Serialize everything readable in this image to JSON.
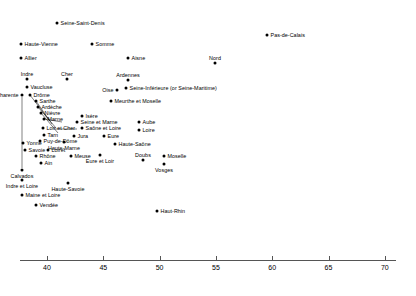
{
  "chart_data": {
    "type": "scatter",
    "title": "",
    "subtitle": "",
    "xlabel": "",
    "ylabel": "",
    "xlim": [
      37.0,
      70.0
    ],
    "ylim": [
      0,
      1
    ],
    "grid": false,
    "legend": "none",
    "axis": {
      "ticks": [
        40,
        45,
        50,
        55,
        60,
        65,
        70
      ],
      "tick_labels": [
        "40",
        "45",
        "50",
        "55",
        "60",
        "65",
        "70"
      ],
      "orientation": "horizontal",
      "position": "bottom"
    },
    "note": "Single-axis dot plot: each French department plotted by its x value; vertical offsets are for label separation only.",
    "points": [
      {
        "label": "Seine-Saint-Denis",
        "x": 44.4,
        "px": 57,
        "py": 23,
        "side": "r"
      },
      {
        "label": "Haute-Vienne",
        "x": 38.7,
        "px": 21,
        "py": 44,
        "side": "r"
      },
      {
        "label": "Somme",
        "x": 44.2,
        "px": 92,
        "py": 44,
        "side": "r"
      },
      {
        "label": "Pas-de-Calais",
        "x": 60.9,
        "px": 267,
        "py": 35,
        "side": "r"
      },
      {
        "label": "Allier",
        "x": 38.6,
        "px": 21,
        "py": 58,
        "side": "r"
      },
      {
        "label": "Aisne",
        "x": 46.4,
        "px": 128,
        "py": 58,
        "side": "r"
      },
      {
        "label": "Nord",
        "x": 52.5,
        "px": 215,
        "py": 63,
        "side": "cb"
      },
      {
        "label": "Indre",
        "x": 38.4,
        "px": 27,
        "py": 79,
        "side": "cb"
      },
      {
        "label": "Cher",
        "x": 41.2,
        "px": 67,
        "py": 79,
        "side": "cb"
      },
      {
        "label": "Ardennes",
        "x": 47.7,
        "px": 128,
        "py": 80,
        "side": "cb"
      },
      {
        "label": "Vaucluse",
        "x": 38.4,
        "px": 27,
        "py": 87,
        "side": "r"
      },
      {
        "label": "Oise",
        "x": 46.0,
        "px": 117,
        "py": 90,
        "side": "l"
      },
      {
        "label": "Seine-Inférieure (or Seine-Maritime)",
        "x": 47.6,
        "px": 126,
        "py": 88,
        "side": "r"
      },
      {
        "label": "Charente",
        "x": 38.0,
        "px": 22,
        "py": 95,
        "side": "l"
      },
      {
        "label": "Drôme",
        "x": 38.9,
        "px": 30,
        "py": 95,
        "side": "r"
      },
      {
        "label": "Sarthe",
        "x": 39.5,
        "px": 36,
        "py": 101,
        "side": "r"
      },
      {
        "label": "Meurthe et Moselle",
        "x": 47.1,
        "px": 111,
        "py": 101,
        "side": "r"
      },
      {
        "label": "Ardèche",
        "x": 39.6,
        "px": 38,
        "py": 107,
        "side": "r"
      },
      {
        "label": "Nièvre",
        "x": 39.8,
        "px": 41,
        "py": 113,
        "side": "r"
      },
      {
        "label": "Isère",
        "x": 42.9,
        "px": 82,
        "py": 116,
        "side": "r"
      },
      {
        "label": "Marne",
        "x": 40.1,
        "px": 44,
        "py": 119,
        "side": "r"
      },
      {
        "label": "Seine et Marne",
        "x": 42.6,
        "px": 77,
        "py": 122,
        "side": "r"
      },
      {
        "label": "Aube",
        "x": 48.8,
        "px": 139,
        "py": 122,
        "side": "r"
      },
      {
        "label": "Loir et Cher",
        "x": 40.0,
        "px": 43,
        "py": 128,
        "side": "r"
      },
      {
        "label": "Saône et Loire",
        "x": 42.9,
        "px": 82,
        "py": 128,
        "side": "r"
      },
      {
        "label": "Loire",
        "x": 48.8,
        "px": 139,
        "py": 130,
        "side": "r"
      },
      {
        "label": "Tarn",
        "x": 39.9,
        "px": 44,
        "py": 135,
        "side": "r"
      },
      {
        "label": "Jura",
        "x": 42.4,
        "px": 74,
        "py": 136,
        "side": "r"
      },
      {
        "label": "Eure",
        "x": 44.6,
        "px": 104,
        "py": 136,
        "side": "r"
      },
      {
        "label": "Haute-Marne",
        "x": 41.6,
        "px": 64,
        "py": 142,
        "side": "c"
      },
      {
        "label": "Yonne",
        "x": 38.1,
        "px": 23,
        "py": 143,
        "side": "r"
      },
      {
        "label": "Puy-de-Dôme",
        "x": 39.6,
        "px": 40,
        "py": 141,
        "side": "r"
      },
      {
        "label": "Haute-Saône",
        "x": 47.3,
        "px": 115,
        "py": 144,
        "side": "r"
      },
      {
        "label": "Savoie",
        "x": 38.4,
        "px": 25,
        "py": 150,
        "side": "r"
      },
      {
        "label": "Loiret",
        "x": 40.4,
        "px": 48,
        "py": 150,
        "side": "r"
      },
      {
        "label": "Rhône",
        "x": 39.5,
        "px": 36,
        "py": 156,
        "side": "r"
      },
      {
        "label": "Meuse",
        "x": 42.2,
        "px": 71,
        "py": 156,
        "side": "r"
      },
      {
        "label": "Eure et Loir",
        "x": 44.4,
        "px": 100,
        "py": 155,
        "side": "c"
      },
      {
        "label": "Moselle",
        "x": 52.0,
        "px": 164,
        "py": 156,
        "side": "r"
      },
      {
        "label": "Doubs",
        "x": 49.6,
        "px": 143,
        "py": 160,
        "side": "cb"
      },
      {
        "label": "Vosges",
        "x": 52.0,
        "px": 164,
        "py": 164,
        "side": "c"
      },
      {
        "label": "Ain",
        "x": 39.4,
        "px": 41,
        "py": 163,
        "side": "r"
      },
      {
        "label": "Calvados",
        "x": 38.0,
        "px": 22,
        "py": 170,
        "side": "c"
      },
      {
        "label": "Indre et Loire",
        "x": 38.0,
        "px": 22,
        "py": 180,
        "side": "c"
      },
      {
        "label": "Haute-Savoie",
        "x": 41.8,
        "px": 68,
        "py": 183,
        "side": "c"
      },
      {
        "label": "Haut-Rhin",
        "x": 50.3,
        "px": 157,
        "py": 211,
        "side": "r"
      },
      {
        "label": "Maine et Loire",
        "x": 38.5,
        "px": 22,
        "py": 195,
        "side": "r"
      },
      {
        "label": "Vendée",
        "x": 39.4,
        "px": 36,
        "py": 205,
        "side": "r"
      }
    ],
    "leaders": [
      {
        "from": [
          30,
          95
        ],
        "to": [
          49,
          120
        ]
      },
      {
        "from": [
          36,
          101
        ],
        "to": [
          52,
          124
        ]
      },
      {
        "from": [
          38,
          107
        ],
        "to": [
          56,
          128
        ]
      },
      {
        "from": [
          41,
          113
        ],
        "to": [
          58,
          133
        ]
      },
      {
        "from": [
          22,
          97
        ],
        "to": [
          22,
          168
        ]
      },
      {
        "from": [
          44,
          119
        ],
        "to": [
          62,
          122
        ]
      },
      {
        "from": [
          55,
          129
        ],
        "to": [
          77,
          129
        ]
      }
    ]
  }
}
